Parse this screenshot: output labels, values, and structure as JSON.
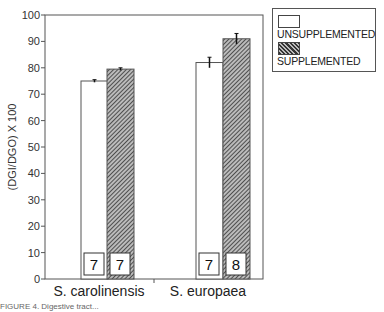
{
  "chart_data": {
    "type": "bar",
    "title": "",
    "xlabel": "",
    "ylabel": "(DGI/DGO) X 100",
    "ylim": [
      0,
      100
    ],
    "yticks": [
      0,
      10,
      20,
      30,
      40,
      50,
      60,
      70,
      80,
      90,
      100
    ],
    "categories": [
      "S. carolinensis",
      "S. europaea"
    ],
    "series": [
      {
        "name": "UNSUPPLEMENTED",
        "values": [
          75,
          82
        ],
        "errors": [
          0.5,
          2
        ],
        "n": [
          7,
          7
        ],
        "fill": "white"
      },
      {
        "name": "SUPPLEMENTED",
        "values": [
          79.5,
          91
        ],
        "errors": [
          0.5,
          2
        ],
        "n": [
          7,
          8
        ],
        "fill": "hatched"
      }
    ],
    "legend_position": "right-top",
    "grid": false
  },
  "legend": {
    "items": [
      {
        "label": "UNSUPPLEMENTED"
      },
      {
        "label": "SUPPLEMENTED"
      }
    ]
  },
  "caption": "FIGURE 4. Digestive tract..."
}
